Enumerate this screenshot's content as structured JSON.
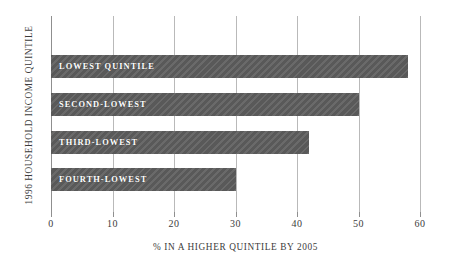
{
  "chart_data": {
    "type": "bar",
    "orientation": "horizontal",
    "title": "",
    "xlabel": "% IN A HIGHER QUINTILE BY 2005",
    "ylabel": "1996 HOUSEHOLD INCOME QUINTILE",
    "categories": [
      "LOWEST QUINTILE",
      "SECOND-LOWEST",
      "THIRD-LOWEST",
      "FOURTH-LOWEST"
    ],
    "values": [
      58,
      50,
      42,
      30
    ],
    "xlim": [
      0,
      60
    ],
    "xticks": [
      0,
      10,
      20,
      30,
      40,
      50,
      60
    ],
    "xtick_labels": [
      "0",
      "10",
      "20",
      "30",
      "40",
      "50",
      "60"
    ],
    "grid": "vertical",
    "legend": "none",
    "bar_color": "#595959",
    "bar_label_color": "#ffffff",
    "gridline_color": "#b9b9b9",
    "axis_color": "#8f8f8f",
    "background": "#ffffff"
  }
}
